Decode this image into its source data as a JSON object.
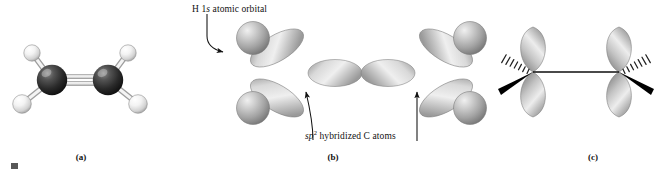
{
  "figure": {
    "background_color": "#ffffff"
  },
  "panels": [
    {
      "id": "a",
      "caption": "(a)",
      "description": "ball-and-stick model of ethene",
      "molecule": {
        "formula": "C2H4",
        "name": "ethene",
        "atoms": [
          {
            "element": "C",
            "label": "C1",
            "color": "#2e2e2e",
            "x": 52,
            "y": 80,
            "r": 15
          },
          {
            "element": "C",
            "label": "C2",
            "color": "#2e2e2e",
            "x": 108,
            "y": 80,
            "r": 15
          },
          {
            "element": "H",
            "label": "H1",
            "color": "#f2f2f2",
            "x": 32,
            "y": 53,
            "r": 8
          },
          {
            "element": "H",
            "label": "H2",
            "color": "#f2f2f2",
            "x": 21,
            "y": 104,
            "r": 9
          },
          {
            "element": "H",
            "label": "H3",
            "color": "#f2f2f2",
            "x": 128,
            "y": 53,
            "r": 8
          },
          {
            "element": "H",
            "label": "H4",
            "color": "#f2f2f2",
            "x": 139,
            "y": 104,
            "r": 9
          }
        ],
        "bonds": [
          {
            "from": "C1",
            "to": "C2",
            "order": 2
          },
          {
            "from": "C1",
            "to": "H1",
            "order": 1
          },
          {
            "from": "C1",
            "to": "H2",
            "order": 1
          },
          {
            "from": "C2",
            "to": "H3",
            "order": 1
          },
          {
            "from": "C2",
            "to": "H4",
            "order": 1
          }
        ]
      }
    },
    {
      "id": "b",
      "caption": "(b)",
      "description": "sp2 hybrid orbital overlap forming sigma bonds",
      "annotations": [
        {
          "name": "h-1s-orbital-label",
          "text_plain": "H 1s atomic orbital",
          "text_parts": [
            {
              "t": "H 1",
              "style": "normal"
            },
            {
              "t": "s",
              "style": "italic"
            },
            {
              "t": " atomic orbital",
              "style": "normal"
            }
          ],
          "x": 192,
          "y": 5,
          "leader": "curved line down to arrowhead at upper-left H sphere"
        },
        {
          "name": "sp2-carbon-label",
          "text_plain": "sp2 hybridized C atoms",
          "text_parts": [
            {
              "t": "sp",
              "style": "italic"
            },
            {
              "t": "2",
              "style": "superscript"
            },
            {
              "t": " hybridized C atoms",
              "style": "normal"
            }
          ],
          "x": 305,
          "y": 132,
          "leader": "two curved lines up to arrowheads at the two carbon nuclei"
        }
      ],
      "orbitals": {
        "sigma_cc": {
          "type": "sp2-sp2",
          "count": 1,
          "orientation": "horizontal"
        },
        "sigma_ch": {
          "type": "sp2-1s",
          "count": 4
        },
        "hydrogen_spheres": 4,
        "lobe_color": "#9a9a9a",
        "highlight_color": "#e8e8e8"
      }
    },
    {
      "id": "c",
      "caption": "(c)",
      "description": "unhybridized 2p orbitals overlapping side-on to form the pi bond",
      "orbitals": {
        "p_orbitals": 2,
        "orientation": "vertical",
        "bond_drawn": "sigma framework shown as line, hashed wedge and solid wedge at each carbon",
        "lobe_color": "#9a9a9a",
        "wedge_color": "#000000",
        "hash_color": "#2b2b2b"
      }
    }
  ],
  "colors": {
    "carbon": "#2e2e2e",
    "hydrogen": "#f2f2f2",
    "orbital_gray": "#9a9a9a",
    "text": "#111111",
    "line": "#1a1a1a"
  }
}
